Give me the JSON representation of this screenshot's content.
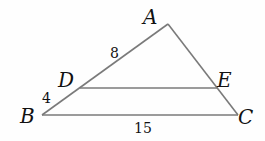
{
  "diagram": {
    "type": "triangle-with-parallel-segment",
    "vertices": {
      "A": {
        "label": "A",
        "x": 168,
        "y": 24
      },
      "B": {
        "label": "B",
        "x": 42,
        "y": 115
      },
      "C": {
        "label": "C",
        "x": 238,
        "y": 115
      },
      "D": {
        "label": "D",
        "x": 80,
        "y": 88
      },
      "E": {
        "label": "E",
        "x": 218,
        "y": 88
      }
    },
    "measurements": {
      "AD": "8",
      "DB": "4",
      "BC": "15"
    },
    "colors": {
      "line": "#7a7a7a",
      "text": "#111111"
    }
  }
}
